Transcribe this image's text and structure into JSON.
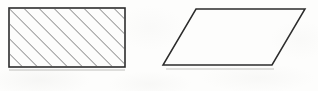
{
  "figure": {
    "canvas": {
      "width": 318,
      "height": 91
    },
    "background_color": "#fdfdfc",
    "stroke_color": "#2b2b2b",
    "hatch_color": "#4a4a4a",
    "shapes": [
      {
        "id": "hatched-rectangle",
        "label": "Hatched rectangle",
        "type": "rectangle",
        "filled": true,
        "fill_style": "diagonal-hatch",
        "hatch_direction": "backslash",
        "hatch_spacing_px": 7.5,
        "hatch_stroke_width_px": 1.1,
        "stroke_width_px": 1.6,
        "points": "9,8 125,8 125,67 9,67",
        "vertices": [
          {
            "name": "top-left",
            "x": 9,
            "y": 8
          },
          {
            "name": "top-right",
            "x": 125,
            "y": 8
          },
          {
            "name": "bottom-right",
            "x": 125,
            "y": 67
          },
          {
            "name": "bottom-left",
            "x": 9,
            "y": 67
          }
        ],
        "width_px": 116,
        "height_px": 59
      },
      {
        "id": "open-parallelogram",
        "label": "Open parallelogram",
        "type": "parallelogram",
        "filled": false,
        "fill_style": "none",
        "stroke_width_px": 1.5,
        "points": "196,9 305,9 272,65 163,65",
        "vertices": [
          {
            "name": "top-left",
            "x": 196,
            "y": 9
          },
          {
            "name": "top-right",
            "x": 305,
            "y": 9
          },
          {
            "name": "bottom-right",
            "x": 272,
            "y": 65
          },
          {
            "name": "bottom-left",
            "x": 163,
            "y": 65
          }
        ],
        "slant_offset_px": 33,
        "base_px": 109,
        "height_px": 56
      }
    ],
    "scan_artifacts": [
      {
        "id": "smudge-under-rectangle",
        "x": 9,
        "y": 69,
        "width": 116,
        "height": 2
      },
      {
        "id": "smudge-under-parallelogram",
        "x": 166,
        "y": 68,
        "width": 108,
        "height": 2
      }
    ]
  }
}
